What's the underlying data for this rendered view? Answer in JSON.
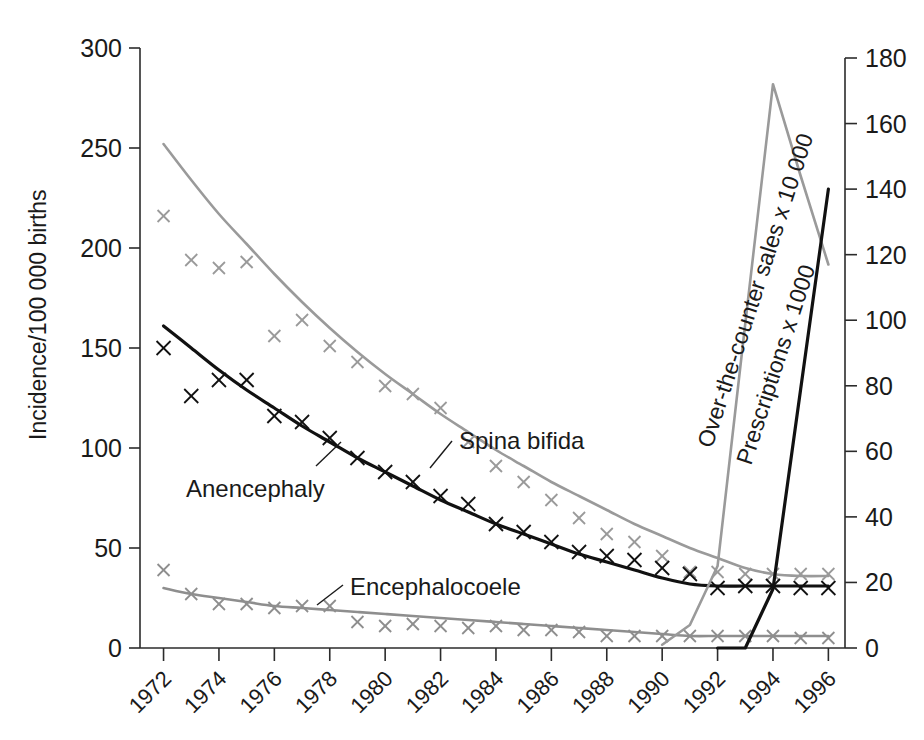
{
  "chart_data": {
    "type": "line",
    "title": "",
    "xlabel": "",
    "ylabel": "Incidence/100 000 births",
    "y2label": "",
    "xlim": [
      1971,
      1996.6
    ],
    "ylim": [
      0,
      300
    ],
    "y2lim": [
      0,
      180
    ],
    "grid": false,
    "legend_position": "inline-annotations",
    "x_tick_labels": [
      "1972",
      "1974",
      "1976",
      "1978",
      "1980",
      "1982",
      "1984",
      "1986",
      "1988",
      "1990",
      "1992",
      "1994",
      "1996"
    ],
    "x_tick_values": [
      1972,
      1974,
      1976,
      1978,
      1980,
      1982,
      1984,
      1986,
      1988,
      1990,
      1992,
      1994,
      1996
    ],
    "y_tick_labels": [
      "0",
      "50",
      "100",
      "150",
      "200",
      "250",
      "300"
    ],
    "y_tick_values": [
      0,
      50,
      100,
      150,
      200,
      250,
      300
    ],
    "y2_tick_labels": [
      "0",
      "20",
      "40",
      "60",
      "80",
      "100",
      "120",
      "140",
      "160",
      "180"
    ],
    "y2_tick_values": [
      0,
      20,
      40,
      60,
      80,
      100,
      120,
      140,
      160,
      180
    ],
    "x": [
      1972,
      1973,
      1974,
      1975,
      1976,
      1977,
      1978,
      1979,
      1980,
      1981,
      1982,
      1983,
      1984,
      1985,
      1986,
      1987,
      1988,
      1989,
      1990,
      1991,
      1992,
      1993,
      1994,
      1995,
      1996
    ],
    "series": [
      {
        "name": "Spina bifida",
        "axis": "left",
        "color": "#9a9a9a",
        "marker": "x",
        "markers": [
          216,
          194,
          190,
          193,
          156,
          164,
          151,
          143,
          131,
          127,
          120,
          103,
          91,
          83,
          74,
          65,
          57,
          53,
          46,
          38,
          38,
          37,
          37,
          37,
          37
        ],
        "fit": [
          252,
          234,
          217,
          202,
          187,
          173,
          160,
          148,
          137,
          127,
          117,
          108,
          99,
          91,
          83,
          76,
          69,
          62,
          56,
          50,
          45,
          40,
          37,
          36,
          36
        ]
      },
      {
        "name": "Anencephaly",
        "axis": "left",
        "color": "#111111",
        "marker": "x",
        "markers": [
          150,
          126,
          134,
          134,
          116,
          113,
          105,
          95,
          88,
          83,
          76,
          72,
          62,
          58,
          53,
          48,
          46,
          44,
          40,
          37,
          30,
          31,
          31,
          30,
          30
        ],
        "fit": [
          161,
          150,
          139,
          129,
          120,
          111,
          103,
          95,
          88,
          81,
          74,
          68,
          62,
          57,
          52,
          47,
          43,
          39,
          35,
          32,
          31,
          31,
          31,
          31,
          31
        ]
      },
      {
        "name": "Encephalocoele",
        "axis": "left",
        "color": "#8e8e8e",
        "marker": "x",
        "markers": [
          39,
          27,
          22,
          22,
          20,
          21,
          21,
          13,
          11,
          12,
          11,
          10,
          11,
          9,
          9,
          8,
          6,
          6,
          6,
          6,
          6,
          6,
          6,
          5,
          5
        ],
        "fit": [
          30,
          27,
          25,
          23,
          21,
          20,
          19,
          18,
          17,
          16,
          15,
          14,
          13,
          12,
          11,
          10,
          9,
          8,
          7,
          6,
          6,
          6,
          6,
          6,
          6
        ]
      },
      {
        "name": "Over-the-counter sales x 10 000",
        "axis": "right",
        "color": "#9a9a9a",
        "marker": "none",
        "x": [
          1990,
          1991,
          1992,
          1993,
          1994,
          1995,
          1996
        ],
        "values": [
          1,
          7,
          25,
          99,
          172,
          144,
          117
        ]
      },
      {
        "name": "Prescriptions x 1000",
        "axis": "right",
        "color": "#111111",
        "marker": "none",
        "x": [
          1992,
          1993,
          1994,
          1995,
          1996
        ],
        "values": [
          0,
          0,
          18,
          79,
          140
        ]
      }
    ],
    "annotations": [
      {
        "text": "Spina bifida",
        "series": "Spina bifida"
      },
      {
        "text": "Anencephaly",
        "series": "Anencephaly"
      },
      {
        "text": "Encephalocoele",
        "series": "Encephalocoele"
      },
      {
        "text": "Over-the-counter sales x 10 000",
        "series": "Over-the-counter sales x 10 000"
      },
      {
        "text": "Prescriptions x 1000",
        "series": "Prescriptions x 1000"
      }
    ]
  },
  "labels": {
    "y_axis_title": "Incidence/100 000 births",
    "spina_bifida": "Spina bifida",
    "anencephaly": "Anencephaly",
    "encephalocoele": "Encephalocoele",
    "otc_sales": "Over-the-counter sales x 10 000",
    "prescriptions": "Prescriptions x 1000"
  },
  "colors": {
    "axis": "#2b2b2b",
    "spina_bifida": "#9a9a9a",
    "anencephaly": "#111111",
    "encephalocoele": "#8e8e8e",
    "otc_sales": "#9a9a9a",
    "prescriptions": "#111111",
    "background": "#ffffff"
  }
}
